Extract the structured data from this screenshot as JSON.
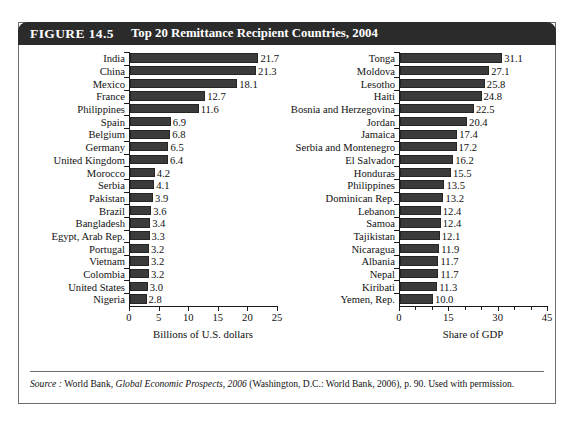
{
  "figure": {
    "number": "FIGURE 14.5",
    "title": "Top 20 Remittance Recipient Countries, 2004",
    "source_prefix": "Source :",
    "source_publisher": "World Bank,",
    "source_work": "Global Economic Prospects, 2006",
    "source_rest": "(Washington, D.C.: World Bank, 2006), p. 90. Used with permission."
  },
  "chart_data": [
    {
      "type": "bar",
      "orientation": "horizontal",
      "title": "Top 20 Remittance Recipient Countries, 2004",
      "panel": "left",
      "xlabel": "Billions of U.S. dollars",
      "ylabel": "",
      "xlim": [
        0,
        25
      ],
      "xticks": [
        0,
        5,
        10,
        15,
        20,
        25
      ],
      "xtick_labels": [
        "0",
        "5",
        "10",
        "15",
        "20",
        "25"
      ],
      "grid": false,
      "legend": "none",
      "bar_color": "#3b3b3b",
      "categories": [
        "India",
        "China",
        "Mexico",
        "France",
        "Philippines",
        "Spain",
        "Belgium",
        "Germany",
        "United Kingdom",
        "Morocco",
        "Serbia",
        "Pakistan",
        "Brazil",
        "Bangladesh",
        "Egypt, Arab Rep.",
        "Portugal",
        "Vietnam",
        "Colombia",
        "United States",
        "Nigeria"
      ],
      "values": [
        21.7,
        21.3,
        18.1,
        12.7,
        11.6,
        6.9,
        6.8,
        6.5,
        6.4,
        4.2,
        4.1,
        3.9,
        3.6,
        3.4,
        3.3,
        3.2,
        3.2,
        3.2,
        3.0,
        2.8
      ],
      "value_labels": [
        "21.7",
        "21.3",
        "18.1",
        "12.7",
        "11.6",
        "6.9",
        "6.8",
        "6.5",
        "6.4",
        "4.2",
        "4.1",
        "3.9",
        "3.6",
        "3.4",
        "3.3",
        "3.2",
        "3.2",
        "3.2",
        "3.0",
        "2.8"
      ]
    },
    {
      "type": "bar",
      "orientation": "horizontal",
      "title": "Top 20 Remittance Recipient Countries, 2004",
      "panel": "right",
      "xlabel": "Share of GDP",
      "ylabel": "",
      "xlim": [
        0,
        45
      ],
      "xticks": [
        0,
        15,
        30,
        45
      ],
      "xtick_labels": [
        "0",
        "15",
        "30",
        "45"
      ],
      "grid": false,
      "legend": "none",
      "bar_color": "#3b3b3b",
      "categories": [
        "Tonga",
        "Moldova",
        "Lesotho",
        "Haiti",
        "Bosnia and Herzegovina",
        "Jordan",
        "Jamaica",
        "Serbia and Montenegro",
        "El Salvador",
        "Honduras",
        "Philippines",
        "Dominican Rep.",
        "Lebanon",
        "Samoa",
        "Tajikistan",
        "Nicaragua",
        "Albania",
        "Nepal",
        "Kiribati",
        "Yemen, Rep."
      ],
      "values": [
        31.1,
        27.1,
        25.8,
        24.8,
        22.5,
        20.4,
        17.4,
        17.2,
        16.2,
        15.5,
        13.5,
        13.2,
        12.4,
        12.4,
        12.1,
        11.9,
        11.7,
        11.7,
        11.3,
        10.0
      ],
      "value_labels": [
        "31.1",
        "27.1",
        "25.8",
        "24.8",
        "22.5",
        "20.4",
        "17.4",
        "17.2",
        "16.2",
        "15.5",
        "13.5",
        "13.2",
        "12.4",
        "12.4",
        "12.1",
        "11.9",
        "11.7",
        "11.7",
        "11.3",
        "10.0"
      ]
    }
  ]
}
